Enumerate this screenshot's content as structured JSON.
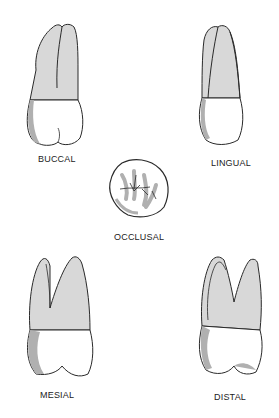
{
  "figure": {
    "views": [
      {
        "id": "buccal",
        "label": "BUCCAL"
      },
      {
        "id": "lingual",
        "label": "LINGUAL"
      },
      {
        "id": "occlusal",
        "label": "OCCLUSAL"
      },
      {
        "id": "mesial",
        "label": "MESIAL"
      },
      {
        "id": "distal",
        "label": "DISTAL"
      }
    ]
  },
  "colors": {
    "outline": "#2a2a2a",
    "root": "#d8d8d8",
    "root_shade": "#c4c4c4",
    "crown": "#ffffff",
    "crown_shade": "#b0b0b0"
  }
}
